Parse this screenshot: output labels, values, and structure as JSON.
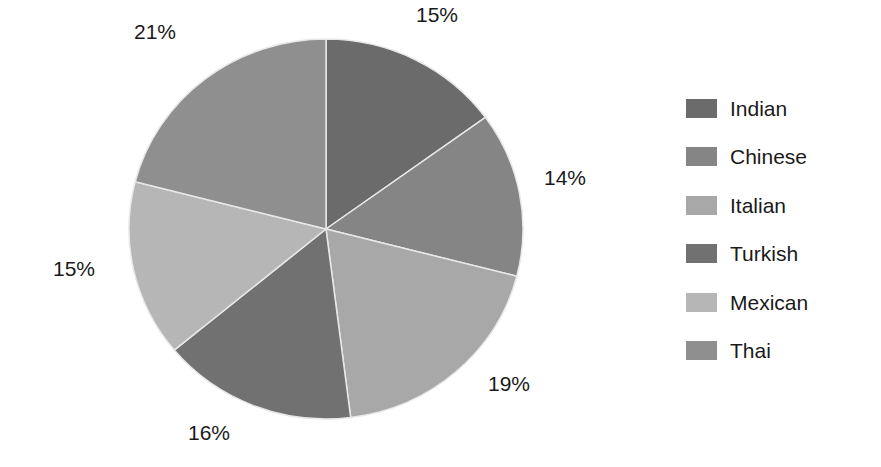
{
  "chart_data": {
    "type": "pie",
    "title": "",
    "categories": [
      "Indian",
      "Chinese",
      "Italian",
      "Turkish",
      "Mexican",
      "Thai"
    ],
    "values": [
      15,
      14,
      19,
      16,
      15,
      21
    ],
    "labels": [
      "15%",
      "14%",
      "19%",
      "16%",
      "15%",
      "21%"
    ],
    "colors": [
      "#6b6b6b",
      "#858585",
      "#a8a8a8",
      "#717171",
      "#b6b6b6",
      "#8f8f8f"
    ],
    "start_angle": "12 o'clock",
    "direction": "clockwise",
    "legend_position": "right",
    "slice_border_color": "#e8e8e8"
  },
  "legend": {
    "items": [
      {
        "label": "Indian",
        "color": "#6b6b6b"
      },
      {
        "label": "Chinese",
        "color": "#858585"
      },
      {
        "label": "Italian",
        "color": "#a8a8a8"
      },
      {
        "label": "Turkish",
        "color": "#717171"
      },
      {
        "label": "Mexican",
        "color": "#b6b6b6"
      },
      {
        "label": "Thai",
        "color": "#8f8f8f"
      }
    ]
  },
  "pct_labels": [
    {
      "text": "15%",
      "x": 437,
      "y": 14
    },
    {
      "text": "14%",
      "x": 565,
      "y": 177
    },
    {
      "text": "19%",
      "x": 509,
      "y": 383
    },
    {
      "text": "16%",
      "x": 209,
      "y": 432
    },
    {
      "text": "15%",
      "x": 74,
      "y": 268
    },
    {
      "text": "21%",
      "x": 155,
      "y": 31
    }
  ]
}
